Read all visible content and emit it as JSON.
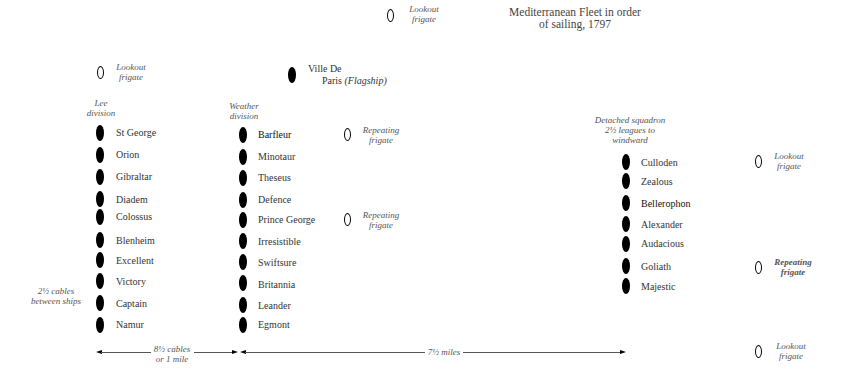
{
  "title": {
    "line1": "Mediterranean Fleet in order",
    "line2": "of sailing, 1797"
  },
  "top_lookout": {
    "line1": "Lookout",
    "line2": "frigate"
  },
  "lee_lookout": {
    "line1": "Lookout",
    "line2": "frigate"
  },
  "flagship": {
    "line1": "Ville De",
    "line2": "Paris",
    "note": "(Flagship)"
  },
  "lee_division": {
    "label_line1": "Lee",
    "label_line2": "division",
    "ships": [
      "St George",
      "Orion",
      "Gibraltar",
      "Diadem",
      "Colossus",
      "Blenheim",
      "Excellent",
      "Victory",
      "Captain",
      "Namur"
    ]
  },
  "weather_division": {
    "label_line1": "Weather",
    "label_line2": "division",
    "ships": [
      "Barfleur",
      "Minotaur",
      "Theseus",
      "Defence",
      "Prince George",
      "Irresistible",
      "Swiftsure",
      "Britannia",
      "Leander",
      "Egmont"
    ]
  },
  "repeating_frigates_weather": [
    {
      "line1": "Repeating",
      "line2": "frigate"
    },
    {
      "line1": "Repeating",
      "line2": "frigate"
    }
  ],
  "detached_squadron": {
    "label_line1": "Detached squadron",
    "label_line2": "2½ leagues to",
    "label_line3": "windward",
    "ships": [
      "Culloden",
      "Zealous",
      "Bellerophon",
      "Alexander",
      "Audacious",
      "Goliath",
      "Majestic"
    ]
  },
  "right_frigates": [
    {
      "line1": "Lookout",
      "line2": "frigate"
    },
    {
      "line1": "Repeating",
      "line2": "frigate"
    },
    {
      "line1": "Lookout",
      "line2": "frigate"
    }
  ],
  "spacing_note": {
    "line1": "2½ cables",
    "line2": "between ships"
  },
  "distance_1": {
    "line1": "8½ cables",
    "line2": "or 1 mile"
  },
  "distance_2": {
    "label": "7½ miles"
  }
}
